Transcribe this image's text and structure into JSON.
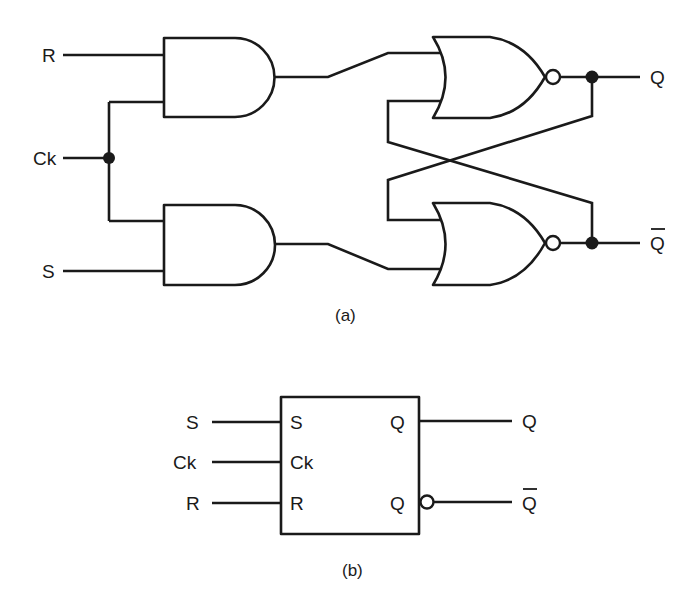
{
  "figure": {
    "colors": {
      "ink": "#1a1a1a",
      "background": "#ffffff"
    }
  },
  "circuit_a": {
    "caption": "(a)",
    "inputs": [
      {
        "id": "R",
        "label": "R"
      },
      {
        "id": "Ck",
        "label": "Ck"
      },
      {
        "id": "S",
        "label": "S"
      }
    ],
    "outputs": [
      {
        "id": "Q",
        "label": "Q"
      },
      {
        "id": "Qbar",
        "label": "Q",
        "overbar": true
      }
    ],
    "gates": [
      {
        "id": "and_top",
        "type": "AND",
        "inputs": [
          "R",
          "Ck"
        ]
      },
      {
        "id": "and_bottom",
        "type": "AND",
        "inputs": [
          "Ck",
          "S"
        ]
      },
      {
        "id": "nor_top",
        "type": "NOR",
        "inputs": [
          "and_top",
          "Qbar"
        ],
        "output": "Q"
      },
      {
        "id": "nor_bottom",
        "type": "NOR",
        "inputs": [
          "Q",
          "and_bottom"
        ],
        "output": "Qbar"
      }
    ],
    "junctions": [
      "Ck",
      "Q",
      "Qbar"
    ]
  },
  "block_b": {
    "caption": "(b)",
    "outer_inputs": [
      {
        "label": "S"
      },
      {
        "label": "Ck"
      },
      {
        "label": "R"
      }
    ],
    "inner_inputs": [
      {
        "label": "S"
      },
      {
        "label": "Ck"
      },
      {
        "label": "R"
      }
    ],
    "inner_outputs": [
      {
        "label": "Q"
      },
      {
        "label": "Q"
      }
    ],
    "outer_outputs": [
      {
        "label": "Q",
        "overbar": false
      },
      {
        "label": "Q",
        "overbar": true
      }
    ]
  }
}
